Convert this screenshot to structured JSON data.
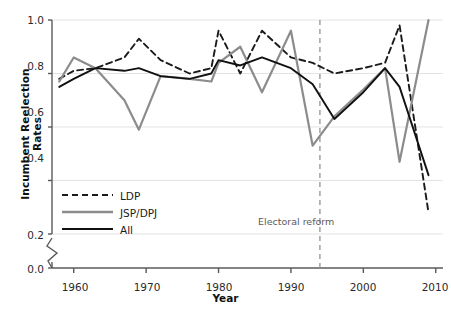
{
  "chart_data": {
    "type": "line",
    "title": "",
    "xlabel": "Year",
    "ylabel": "Incumbent Reelection Rates",
    "xlim": [
      1957,
      2011
    ],
    "ylim": [
      0.18,
      1.02
    ],
    "xticks": [
      "1960",
      "1970",
      "1980",
      "1990",
      "2000",
      "2010"
    ],
    "xtick_values": [
      1960,
      1970,
      1980,
      1990,
      2000,
      2010
    ],
    "yticks": [
      "0.0",
      "0.2",
      "0.4",
      "0.6",
      "0.8",
      "1.0"
    ],
    "ytick_values": [
      0.0,
      0.2,
      0.4,
      0.6,
      0.8,
      1.0
    ],
    "y_axis_break": true,
    "y_axis_break_between": [
      0.0,
      0.2
    ],
    "grid": "horizontal",
    "legend_position": "lower-left-inside",
    "x": [
      1958,
      1960,
      1963,
      1967,
      1969,
      1972,
      1976,
      1979,
      1980,
      1983,
      1986,
      1990,
      1993,
      1996,
      2000,
      2003,
      2005,
      2009
    ],
    "series": [
      {
        "name": "LDP",
        "style": "dashed",
        "color": "#1a1a1a",
        "values": [
          0.78,
          0.81,
          0.82,
          0.86,
          0.93,
          0.85,
          0.8,
          0.82,
          0.96,
          0.8,
          0.96,
          0.86,
          0.84,
          0.8,
          0.82,
          0.84,
          0.98,
          0.28
        ]
      },
      {
        "name": "JSP/DPJ",
        "style": "solid",
        "color": "#8c8c8c",
        "values": [
          0.77,
          0.86,
          0.82,
          0.7,
          0.59,
          0.79,
          0.78,
          0.77,
          0.84,
          0.9,
          0.73,
          0.96,
          0.53,
          0.64,
          0.74,
          0.82,
          0.47,
          1.0
        ]
      },
      {
        "name": "All",
        "style": "solid",
        "color": "#111111",
        "values": [
          0.75,
          0.78,
          0.82,
          0.81,
          0.82,
          0.79,
          0.78,
          0.8,
          0.85,
          0.83,
          0.86,
          0.82,
          0.76,
          0.63,
          0.73,
          0.82,
          0.75,
          0.42
        ]
      }
    ],
    "annotations": [
      {
        "text": "Electoral reform",
        "x_value": 1994,
        "marker": "vertical-dashed-line",
        "color": "#9a9a9a"
      }
    ]
  },
  "legend": {
    "items": [
      {
        "label": "LDP",
        "style": "dashed",
        "color": "#1a1a1a"
      },
      {
        "label": "JSP/DPJ",
        "style": "solid",
        "color": "#8c8c8c"
      },
      {
        "label": "All",
        "style": "solid",
        "color": "#111111"
      }
    ]
  },
  "axes": {
    "y_title": "Incumbent Reelection Rates",
    "x_title": "Year"
  },
  "colors": {
    "grid": "#e3e3e3",
    "axis": "#5a5a5a",
    "ldp": "#1a1a1a",
    "jsp_dpj": "#8c8c8c",
    "all": "#111111",
    "reform_line": "#9a9a9a",
    "background": "#ffffff"
  }
}
